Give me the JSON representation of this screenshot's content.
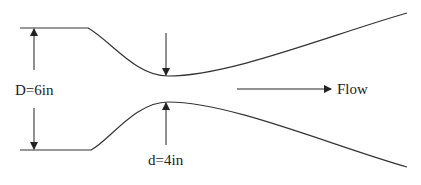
{
  "diagram": {
    "type": "converging-diverging nozzle (venturi) cross-section",
    "labels": {
      "inlet_diameter": "D=6in",
      "throat_diameter": "d=4in",
      "flow": "Flow"
    },
    "colors": {
      "line": "#333333",
      "text": "#222222",
      "background": "#ffffff"
    }
  }
}
